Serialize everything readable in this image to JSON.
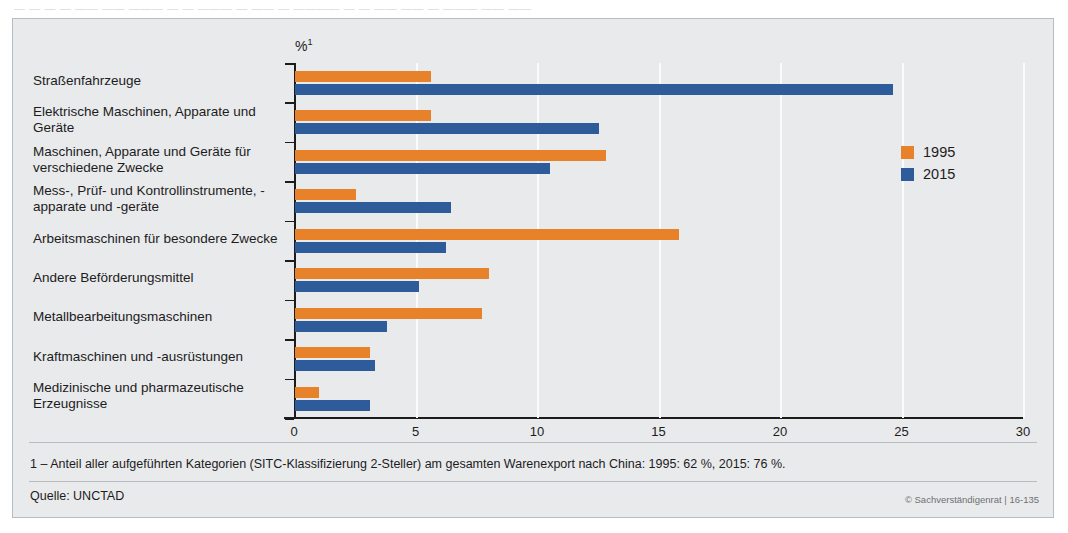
{
  "bleed_text": "— — —  — —— ——  ———  — — ——— —  —— —  ———— — — —— ——  — ———  —— ——",
  "chart_data": {
    "type": "bar",
    "orientation": "horizontal",
    "title": "",
    "xlabel": "%",
    "xlabel_footnote_marker": "1",
    "ylabel": "",
    "xlim": [
      0,
      30
    ],
    "xticks": [
      0,
      5,
      10,
      15,
      20,
      25,
      30
    ],
    "xtick_labels": [
      "0",
      "5",
      "10",
      "15",
      "20",
      "25",
      "30"
    ],
    "grid": "vertical-white-gridlines",
    "legend_position": "upper-right-inside",
    "categories": [
      "Straßenfahrzeuge",
      "Elektrische Maschinen, Apparate und Geräte",
      "Maschinen, Apparate und Geräte für verschiedene Zwecke",
      "Mess-, Prüf- und Kontrollinstrumente, -apparate und -geräte",
      "Arbeitsmaschinen für besondere Zwecke",
      "Andere Beförderungsmittel",
      "Metallbearbeitungsmaschinen",
      "Kraftmaschinen und -ausrüstungen",
      "Medizinische und pharmazeutische Erzeugnisse"
    ],
    "series": [
      {
        "name": "1995",
        "color": "#e8822a",
        "values": [
          5.6,
          5.6,
          12.8,
          2.5,
          15.8,
          8.0,
          7.7,
          3.1,
          1.0
        ]
      },
      {
        "name": "2015",
        "color": "#2e5c9a",
        "values": [
          24.6,
          12.5,
          10.5,
          6.4,
          6.2,
          5.1,
          3.8,
          3.3,
          3.1
        ]
      }
    ]
  },
  "legend": [
    {
      "label": "1995",
      "color": "#e8822a"
    },
    {
      "label": "2015",
      "color": "#2e5c9a"
    }
  ],
  "footer": {
    "footnote": "1 – Anteil aller aufgeführten Kategorien (SITC-Klassifizierung 2-Steller) am gesamten Warenexport nach China: 1995: 62 %, 2015: 76 %.",
    "source": "Quelle: UNCTAD",
    "copyright": "© Sachverständigenrat | 16-135"
  }
}
